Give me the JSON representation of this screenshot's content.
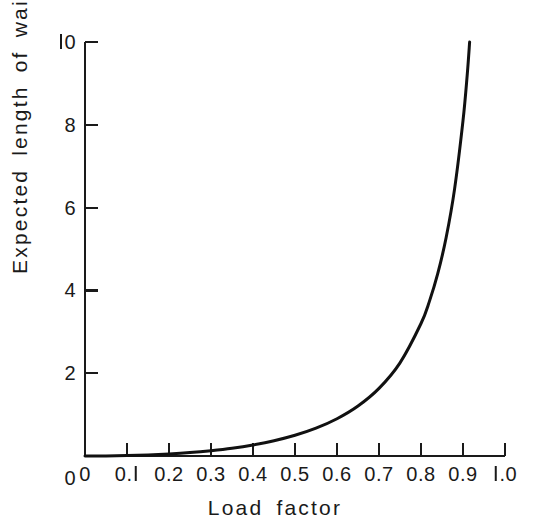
{
  "figure": {
    "background_color": "#ffffff",
    "ink_color": "#1a1a1a",
    "width": 550,
    "height": 532
  },
  "chart_data": {
    "type": "line",
    "title": "",
    "subtitle": "",
    "xlabel": "Load factor",
    "ylabel": "Expected length of waiting line",
    "xlim": [
      0,
      1.0
    ],
    "ylim": [
      0,
      10
    ],
    "grid": false,
    "legend": null,
    "legend_position": "none",
    "annotations": [],
    "x_ticks": [
      {
        "value": 0,
        "label": "0"
      },
      {
        "value": 0.1,
        "label": "0.1"
      },
      {
        "value": 0.2,
        "label": "0.2"
      },
      {
        "value": 0.3,
        "label": "0.3"
      },
      {
        "value": 0.4,
        "label": "0.4"
      },
      {
        "value": 0.5,
        "label": "0.5"
      },
      {
        "value": 0.6,
        "label": "0.6"
      },
      {
        "value": 0.7,
        "label": "0.7"
      },
      {
        "value": 0.8,
        "label": "0.8"
      },
      {
        "value": 0.9,
        "label": "0.9"
      },
      {
        "value": 1.0,
        "label": "1.0"
      }
    ],
    "y_ticks": [
      {
        "value": 0,
        "label": "0"
      },
      {
        "value": 2,
        "label": "2"
      },
      {
        "value": 4,
        "label": "4"
      },
      {
        "value": 6,
        "label": "6"
      },
      {
        "value": 8,
        "label": "8"
      },
      {
        "value": 10,
        "label": "10"
      }
    ],
    "series": [
      {
        "name": "Expected length of waiting line",
        "formula": "L = rho^2 / (1 - rho)",
        "color": "#111111",
        "line_width": 3,
        "x": [
          0.0,
          0.05,
          0.1,
          0.15,
          0.2,
          0.25,
          0.3,
          0.35,
          0.4,
          0.45,
          0.5,
          0.55,
          0.6,
          0.65,
          0.7,
          0.75,
          0.8,
          0.82,
          0.84,
          0.86,
          0.88,
          0.9,
          0.91,
          0.92,
          0.93,
          0.94,
          0.945,
          0.95,
          0.955
        ],
        "y": [
          0.0,
          0.003,
          0.011,
          0.026,
          0.05,
          0.083,
          0.129,
          0.188,
          0.267,
          0.368,
          0.5,
          0.672,
          0.9,
          1.207,
          1.633,
          2.25,
          3.2,
          3.735,
          4.41,
          5.283,
          6.453,
          8.1,
          9.201,
          10.58,
          12.356,
          14.727,
          16.232,
          18.05,
          20.295
        ]
      }
    ]
  },
  "x_axis": {
    "title": "Load factor",
    "tick_labels": [
      "0",
      "0.1",
      "0.2",
      "0.3",
      "0.4",
      "0.5",
      "0.6",
      "0.7",
      "0.8",
      "0.9",
      "1.0"
    ]
  },
  "y_axis": {
    "title": "Expected length of waiting line",
    "tick_labels": [
      "0",
      "2",
      "4",
      "6",
      "8",
      "10"
    ]
  }
}
